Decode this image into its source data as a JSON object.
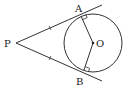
{
  "diagram": {
    "type": "geometry-tangents",
    "labels": {
      "P": "P",
      "A": "A",
      "B": "B",
      "O": "O"
    },
    "points": {
      "P": [
        16,
        43
      ],
      "O": [
        93,
        43
      ],
      "A": [
        81,
        16
      ],
      "B": [
        84,
        70
      ]
    },
    "circle": {
      "center": "O",
      "radius": 29
    },
    "colors": {
      "stroke": "#333333",
      "text": "#222222",
      "background": "#ffffff"
    }
  }
}
